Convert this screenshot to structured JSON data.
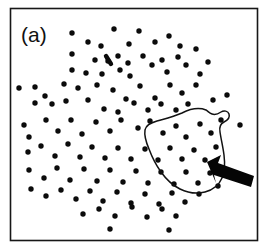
{
  "figure": {
    "panel_label": "(a)",
    "background_color": "#ffffff",
    "frame_color": "#171717",
    "dot_color": "#0b0b0b",
    "contour_color": "#121212",
    "arrow_color": "#050505"
  },
  "chart_data": {
    "type": "scatter",
    "title": "(a)",
    "xlabel": "",
    "ylabel": "",
    "xlim": [
      0,
      265
    ],
    "ylim": [
      0,
      250
    ],
    "grid": false,
    "legend": null,
    "axis_ticks": false,
    "point_count": 126,
    "marker": {
      "shape": "circle",
      "radius_px": 2.7,
      "color": "#0b0b0b"
    },
    "series": [
      {
        "name": "points",
        "points": [
          [
            72,
            33
          ],
          [
            101,
            46
          ],
          [
            114,
            29
          ],
          [
            139,
            31
          ],
          [
            88,
            42
          ],
          [
            118,
            56
          ],
          [
            129,
            44
          ],
          [
            155,
            42
          ],
          [
            169,
            36
          ],
          [
            180,
            46
          ],
          [
            72,
            54
          ],
          [
            95,
            60
          ],
          [
            108,
            61
          ],
          [
            128,
            63
          ],
          [
            143,
            56
          ],
          [
            162,
            60
          ],
          [
            178,
            57
          ],
          [
            196,
            49
          ],
          [
            72,
            70
          ],
          [
            86,
            73
          ],
          [
            102,
            74
          ],
          [
            120,
            70
          ],
          [
            130,
            76
          ],
          [
            152,
            65
          ],
          [
            167,
            72
          ],
          [
            186,
            65
          ],
          [
            200,
            74
          ],
          [
            208,
            62
          ],
          [
            19,
            88
          ],
          [
            35,
            87
          ],
          [
            45,
            96
          ],
          [
            64,
            84
          ],
          [
            78,
            88
          ],
          [
            97,
            85
          ],
          [
            113,
            90
          ],
          [
            126,
            99
          ],
          [
            140,
            86
          ],
          [
            155,
            98
          ],
          [
            170,
            85
          ],
          [
            182,
            93
          ],
          [
            196,
            85
          ],
          [
            213,
            100
          ],
          [
            227,
            95
          ],
          [
            35,
            103
          ],
          [
            52,
            104
          ],
          [
            66,
            101
          ],
          [
            88,
            100
          ],
          [
            104,
            109
          ],
          [
            118,
            112
          ],
          [
            134,
            103
          ],
          [
            148,
            110
          ],
          [
            161,
            104
          ],
          [
            176,
            110
          ],
          [
            188,
            104
          ],
          [
            24,
            125
          ],
          [
            29,
            137
          ],
          [
            46,
            120
          ],
          [
            58,
            131
          ],
          [
            71,
            120
          ],
          [
            82,
            134
          ],
          [
            96,
            122
          ],
          [
            110,
            131
          ],
          [
            121,
            120
          ],
          [
            138,
            128
          ],
          [
            150,
            121
          ],
          [
            163,
            133
          ],
          [
            176,
            126
          ],
          [
            186,
            137
          ],
          [
            200,
            124
          ],
          [
            211,
            133
          ],
          [
            221,
            120
          ],
          [
            240,
            125
          ],
          [
            28,
            152
          ],
          [
            41,
            146
          ],
          [
            55,
            156
          ],
          [
            68,
            144
          ],
          [
            80,
            157
          ],
          [
            92,
            147
          ],
          [
            105,
            158
          ],
          [
            118,
            148
          ],
          [
            131,
            159
          ],
          [
            145,
            149
          ],
          [
            158,
            160
          ],
          [
            170,
            148
          ],
          [
            182,
            159
          ],
          [
            194,
            150
          ],
          [
            205,
            160
          ],
          [
            216,
            147
          ],
          [
            29,
            170
          ],
          [
            44,
            178
          ],
          [
            57,
            168
          ],
          [
            70,
            180
          ],
          [
            84,
            169
          ],
          [
            97,
            181
          ],
          [
            110,
            170
          ],
          [
            123,
            182
          ],
          [
            136,
            171
          ],
          [
            148,
            183
          ],
          [
            161,
            172
          ],
          [
            174,
            184
          ],
          [
            186,
            172
          ],
          [
            198,
            183
          ],
          [
            210,
            173
          ],
          [
            218,
            186
          ],
          [
            31,
            189
          ],
          [
            46,
            196
          ],
          [
            61,
            190
          ],
          [
            76,
            199
          ],
          [
            90,
            191
          ],
          [
            103,
            201
          ],
          [
            117,
            192
          ],
          [
            131,
            203
          ],
          [
            145,
            194
          ],
          [
            159,
            204
          ],
          [
            172,
            193
          ],
          [
            185,
            202
          ],
          [
            199,
            194
          ],
          [
            83,
            214
          ],
          [
            99,
            209
          ],
          [
            115,
            216
          ],
          [
            132,
            207
          ],
          [
            147,
            217
          ],
          [
            162,
            209
          ],
          [
            176,
            216
          ],
          [
            110,
            229
          ],
          [
            169,
            230
          ]
        ]
      }
    ],
    "annotations": [
      {
        "type": "closed-contour",
        "name": "cluster-outline",
        "label": "hand-drawn cluster boundary",
        "approx_center": [
          190,
          152
        ],
        "enclosed_point_estimate": 32
      },
      {
        "type": "arrow",
        "name": "cluster-pointer",
        "label": "arrow indicating cluster",
        "tail": [
          253,
          181
        ],
        "head": [
          209,
          163
        ]
      },
      {
        "type": "text",
        "name": "panel-label",
        "text": "(a)",
        "position": [
          22,
          40
        ]
      }
    ]
  }
}
